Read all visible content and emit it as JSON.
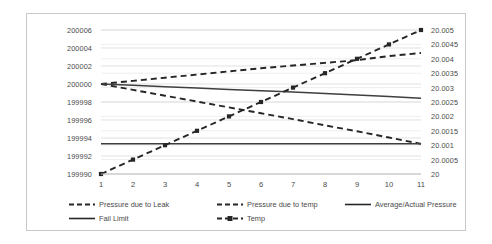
{
  "chart_data": {
    "type": "line",
    "title": "",
    "xlabel": "",
    "ylabel": "",
    "y2label": "",
    "grid": true,
    "legend_position": "bottom",
    "x": [
      1,
      2,
      3,
      4,
      5,
      6,
      7,
      8,
      9,
      10,
      11
    ],
    "xtick_labels": [
      "1",
      "2",
      "3",
      "4",
      "5",
      "6",
      "7",
      "8",
      "9",
      "10",
      "11"
    ],
    "ylim": [
      199990,
      200006
    ],
    "ytick_labels": [
      "200006",
      "200004",
      "200002",
      "200000",
      "199998",
      "199996",
      "199994",
      "199992",
      "199990"
    ],
    "ytick_values": [
      200006,
      200004,
      200002,
      200000,
      199998,
      199996,
      199994,
      199992,
      199990
    ],
    "y2lim": [
      20,
      20.005
    ],
    "y2tick_labels": [
      "20.005",
      "20.0045",
      "20.004",
      "20.0035",
      "20.003",
      "20.0025",
      "20.002",
      "20.0015",
      "20.001",
      "20.0005",
      "20"
    ],
    "y2tick_values": [
      20.005,
      20.0045,
      20.004,
      20.0035,
      20.003,
      20.0025,
      20.002,
      20.0015,
      20.001,
      20.0005,
      20
    ],
    "series": [
      {
        "name": "Pressure due to Leak",
        "axis": "left",
        "style": "dashed",
        "marker": "none",
        "color": "#262626",
        "values": [
          200000,
          199999.35,
          199998.7,
          199998.05,
          199997.4,
          199996.75,
          199996.1,
          199995.4,
          199994.75,
          199994.05,
          199993.35
        ]
      },
      {
        "name": "Pressure due to temp",
        "axis": "left",
        "style": "dashed",
        "marker": "none",
        "color": "#262626",
        "values": [
          200000,
          200000.35,
          200000.7,
          200001.05,
          200001.4,
          200001.75,
          200002.05,
          200002.35,
          200002.65,
          200003.1,
          200003.45
        ]
      },
      {
        "name": "Average/Actual Pressure",
        "axis": "left",
        "style": "solid",
        "marker": "none",
        "color": "#3f3f3f",
        "values": [
          200000,
          199999.85,
          199999.7,
          199999.55,
          199999.4,
          199999.25,
          199999.1,
          199998.95,
          199998.78,
          199998.6,
          199998.42
        ]
      },
      {
        "name": "Fail Limit",
        "axis": "left",
        "style": "solid",
        "marker": "none",
        "color": "#3f3f3f",
        "values": [
          199993.35,
          199993.35,
          199993.35,
          199993.35,
          199993.35,
          199993.35,
          199993.35,
          199993.35,
          199993.35,
          199993.35,
          199993.35
        ]
      },
      {
        "name": "Temp",
        "axis": "right",
        "style": "dashed",
        "marker": "square",
        "color": "#262626",
        "values": [
          20,
          20.0005,
          20.001,
          20.0015,
          20.002,
          20.0025,
          20.003,
          20.0035,
          20.004,
          20.0045,
          20.005
        ]
      }
    ]
  },
  "legend": {
    "items": [
      {
        "label": "Pressure due to Leak",
        "swatch": "dashed-line-swatch"
      },
      {
        "label": "Pressure due to temp",
        "swatch": "dashed-line-swatch"
      },
      {
        "label": "Average/Actual Pressure",
        "swatch": "solid-line-swatch"
      },
      {
        "label": "Fail Limit",
        "swatch": "solid-line-swatch"
      },
      {
        "label": "Temp",
        "swatch": "dashed-marker-line-swatch"
      }
    ]
  }
}
